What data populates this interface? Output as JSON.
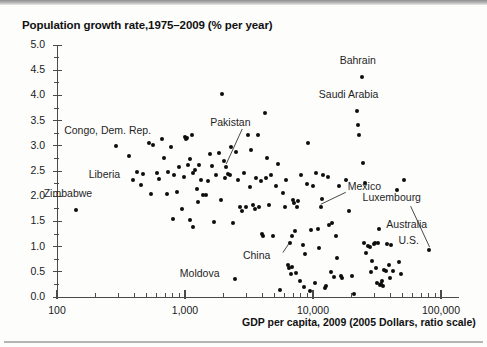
{
  "figure": {
    "title": "Population growth rate,1975–2009 (% per year)",
    "xaxis_title": "GDP per capita, 2009 (2005 Dollars, ratio scale)",
    "dot_color": "#0d0d0d",
    "axis_color": "#4a4a4a"
  },
  "chart_data": {
    "type": "scatter",
    "title": "Population growth rate,1975–2009 (% per year)",
    "xlabel": "GDP per capita, 2009 (2005 Dollars, ratio scale)",
    "ylabel": "Population growth rate,1975–2009 (% per year)",
    "xscale": "log",
    "yscale": "linear",
    "xlim": [
      100,
      100000
    ],
    "ylim": [
      0.0,
      5.0
    ],
    "grid": false,
    "legend": "none",
    "xtick_labels": [
      "100",
      "1,000",
      "10,000",
      "100,000"
    ],
    "xtick_values": [
      100,
      1000,
      10000,
      100000
    ],
    "ytick_labels": [
      "0.0",
      "0.5",
      "1.0",
      "1.5",
      "2.0",
      "2.5",
      "3.0",
      "3.5",
      "4.0",
      "4.5",
      "5.0"
    ],
    "ytick_values": [
      0.0,
      0.5,
      1.0,
      1.5,
      2.0,
      2.5,
      3.0,
      3.5,
      4.0,
      4.5,
      5.0
    ],
    "annotations": [
      {
        "label": "Bahrain",
        "x": 24000,
        "y": 4.37,
        "leader": false
      },
      {
        "label": "Saudi Arabia",
        "x": 22000,
        "y": 3.7,
        "leader": false
      },
      {
        "label": "Pakistan",
        "x": 2100,
        "y": 2.58,
        "leader": true
      },
      {
        "label": "Congo, Dem. Rep.",
        "x": 290,
        "y": 2.99,
        "leader": false
      },
      {
        "label": "Liberia",
        "x": 390,
        "y": 2.33,
        "leader": false
      },
      {
        "label": "Zimbabwe",
        "x": 140,
        "y": 1.72,
        "leader": false
      },
      {
        "label": "Moldova",
        "x": 2450,
        "y": 0.35,
        "leader": false
      },
      {
        "label": "Mexico",
        "x": 11500,
        "y": 1.78,
        "leader": true
      },
      {
        "label": "China",
        "x": 6600,
        "y": 1.08,
        "leader": true
      },
      {
        "label": "Luxembourg",
        "x": 80000,
        "y": 0.93,
        "leader": true
      },
      {
        "label": "Australia",
        "x": 33000,
        "y": 1.35,
        "leader": false
      },
      {
        "label": "U.S.",
        "x": 41000,
        "y": 1.04,
        "leader": false
      }
    ],
    "points": [
      {
        "x": 140,
        "y": 1.72
      },
      {
        "x": 290,
        "y": 2.99
      },
      {
        "x": 390,
        "y": 2.33
      },
      {
        "x": 365,
        "y": 2.79
      },
      {
        "x": 420,
        "y": 2.48
      },
      {
        "x": 455,
        "y": 2.22
      },
      {
        "x": 470,
        "y": 2.45
      },
      {
        "x": 520,
        "y": 3.05
      },
      {
        "x": 540,
        "y": 2.05
      },
      {
        "x": 560,
        "y": 3.01
      },
      {
        "x": 600,
        "y": 2.46
      },
      {
        "x": 630,
        "y": 2.35
      },
      {
        "x": 660,
        "y": 3.13
      },
      {
        "x": 690,
        "y": 2.76
      },
      {
        "x": 720,
        "y": 2.04
      },
      {
        "x": 740,
        "y": 2.48
      },
      {
        "x": 780,
        "y": 2.98
      },
      {
        "x": 800,
        "y": 1.55
      },
      {
        "x": 820,
        "y": 2.42
      },
      {
        "x": 860,
        "y": 2.09
      },
      {
        "x": 900,
        "y": 2.58
      },
      {
        "x": 940,
        "y": 1.75
      },
      {
        "x": 980,
        "y": 2.38
      },
      {
        "x": 1000,
        "y": 3.18
      },
      {
        "x": 1010,
        "y": 3.13
      },
      {
        "x": 1040,
        "y": 3.16
      },
      {
        "x": 1060,
        "y": 2.62
      },
      {
        "x": 1090,
        "y": 1.52
      },
      {
        "x": 1100,
        "y": 2.73
      },
      {
        "x": 1130,
        "y": 3.22
      },
      {
        "x": 1150,
        "y": 2.46
      },
      {
        "x": 1160,
        "y": 1.38
      },
      {
        "x": 1200,
        "y": 2.51
      },
      {
        "x": 1230,
        "y": 2.15
      },
      {
        "x": 1260,
        "y": 1.88
      },
      {
        "x": 1290,
        "y": 2.61
      },
      {
        "x": 1340,
        "y": 2.33
      },
      {
        "x": 1380,
        "y": 2.02
      },
      {
        "x": 1450,
        "y": 2.03
      },
      {
        "x": 1500,
        "y": 2.3
      },
      {
        "x": 1560,
        "y": 2.84
      },
      {
        "x": 1620,
        "y": 2.6
      },
      {
        "x": 1700,
        "y": 1.48
      },
      {
        "x": 1760,
        "y": 2.43
      },
      {
        "x": 1830,
        "y": 2.86
      },
      {
        "x": 1900,
        "y": 1.92
      },
      {
        "x": 1950,
        "y": 4.03
      },
      {
        "x": 2000,
        "y": 2.69
      },
      {
        "x": 2050,
        "y": 2.36
      },
      {
        "x": 2100,
        "y": 2.58
      },
      {
        "x": 2150,
        "y": 2.44
      },
      {
        "x": 2250,
        "y": 2.43
      },
      {
        "x": 2300,
        "y": 2.98
      },
      {
        "x": 2380,
        "y": 1.47
      },
      {
        "x": 2450,
        "y": 0.35
      },
      {
        "x": 2500,
        "y": 2.88
      },
      {
        "x": 2600,
        "y": 2.33
      },
      {
        "x": 2700,
        "y": 1.79
      },
      {
        "x": 2800,
        "y": 1.71
      },
      {
        "x": 2900,
        "y": 2.47
      },
      {
        "x": 3000,
        "y": 1.78
      },
      {
        "x": 3100,
        "y": 3.22
      },
      {
        "x": 3200,
        "y": 2.19
      },
      {
        "x": 3300,
        "y": 2.91
      },
      {
        "x": 3400,
        "y": 1.83
      },
      {
        "x": 3500,
        "y": 1.74
      },
      {
        "x": 3600,
        "y": 2.37
      },
      {
        "x": 3700,
        "y": 3.21
      },
      {
        "x": 3800,
        "y": 1.79
      },
      {
        "x": 3900,
        "y": 2.3
      },
      {
        "x": 4000,
        "y": 1.25
      },
      {
        "x": 4100,
        "y": 1.22
      },
      {
        "x": 4200,
        "y": 3.66
      },
      {
        "x": 4300,
        "y": 2.36
      },
      {
        "x": 4400,
        "y": 2.76
      },
      {
        "x": 4500,
        "y": 1.82
      },
      {
        "x": 4700,
        "y": 2.43
      },
      {
        "x": 4900,
        "y": 1.21
      },
      {
        "x": 5100,
        "y": 2.21
      },
      {
        "x": 5300,
        "y": 2.63
      },
      {
        "x": 5500,
        "y": 0.14
      },
      {
        "x": 5800,
        "y": 2.07
      },
      {
        "x": 6000,
        "y": 1.78
      },
      {
        "x": 6200,
        "y": 2.32
      },
      {
        "x": 6400,
        "y": 0.64
      },
      {
        "x": 6500,
        "y": 0.58
      },
      {
        "x": 6600,
        "y": 1.08
      },
      {
        "x": 6700,
        "y": 0.46
      },
      {
        "x": 6800,
        "y": 1.21
      },
      {
        "x": 6900,
        "y": 0.59
      },
      {
        "x": 7000,
        "y": 1.93
      },
      {
        "x": 7100,
        "y": 1.86
      },
      {
        "x": 7200,
        "y": 1.31
      },
      {
        "x": 7300,
        "y": 0.48
      },
      {
        "x": 7500,
        "y": 1.78
      },
      {
        "x": 7700,
        "y": 1.91
      },
      {
        "x": 7900,
        "y": 0.32
      },
      {
        "x": 8100,
        "y": 2.43
      },
      {
        "x": 8300,
        "y": 1.04
      },
      {
        "x": 8500,
        "y": 0.19
      },
      {
        "x": 8700,
        "y": 0.86
      },
      {
        "x": 8900,
        "y": 2.25
      },
      {
        "x": 9100,
        "y": 3.06
      },
      {
        "x": 9400,
        "y": 0.12
      },
      {
        "x": 9700,
        "y": 1.33
      },
      {
        "x": 10000,
        "y": 2.21
      },
      {
        "x": 10300,
        "y": 0.28
      },
      {
        "x": 10600,
        "y": 2.47
      },
      {
        "x": 10900,
        "y": 1.34
      },
      {
        "x": 11200,
        "y": 0.97
      },
      {
        "x": 11500,
        "y": 1.78
      },
      {
        "x": 11800,
        "y": 1.94
      },
      {
        "x": 12000,
        "y": 2.42
      },
      {
        "x": 12300,
        "y": 0.17
      },
      {
        "x": 12600,
        "y": 0.22
      },
      {
        "x": 13000,
        "y": 2.38
      },
      {
        "x": 13400,
        "y": 1.42
      },
      {
        "x": 13800,
        "y": 0.49
      },
      {
        "x": 14200,
        "y": 1.46
      },
      {
        "x": 14600,
        "y": 0.39
      },
      {
        "x": 15000,
        "y": 1.22
      },
      {
        "x": 15500,
        "y": 0.78
      },
      {
        "x": 16000,
        "y": 2.2
      },
      {
        "x": 16500,
        "y": 0.41
      },
      {
        "x": 17000,
        "y": 0.37
      },
      {
        "x": 18000,
        "y": 2.33
      },
      {
        "x": 19000,
        "y": 1.7
      },
      {
        "x": 20000,
        "y": 0.42
      },
      {
        "x": 21000,
        "y": 0.06
      },
      {
        "x": 22000,
        "y": 3.7
      },
      {
        "x": 22500,
        "y": 3.42
      },
      {
        "x": 23000,
        "y": 3.21
      },
      {
        "x": 24000,
        "y": 4.37
      },
      {
        "x": 24500,
        "y": 2.65
      },
      {
        "x": 25000,
        "y": 1.08
      },
      {
        "x": 25500,
        "y": 2.27
      },
      {
        "x": 26000,
        "y": 0.88
      },
      {
        "x": 27000,
        "y": 1.02
      },
      {
        "x": 28000,
        "y": 0.99
      },
      {
        "x": 28500,
        "y": 0.49
      },
      {
        "x": 29000,
        "y": 0.72
      },
      {
        "x": 30000,
        "y": 1.06
      },
      {
        "x": 30500,
        "y": 1.08
      },
      {
        "x": 31000,
        "y": 0.57
      },
      {
        "x": 31500,
        "y": 0.27
      },
      {
        "x": 32000,
        "y": 1.08
      },
      {
        "x": 33000,
        "y": 1.35
      },
      {
        "x": 33500,
        "y": 0.23
      },
      {
        "x": 34000,
        "y": 0.26
      },
      {
        "x": 34500,
        "y": 0.31
      },
      {
        "x": 35000,
        "y": 0.21
      },
      {
        "x": 36000,
        "y": 0.54
      },
      {
        "x": 37000,
        "y": 0.52
      },
      {
        "x": 38000,
        "y": 1.06
      },
      {
        "x": 39000,
        "y": 0.63
      },
      {
        "x": 40000,
        "y": 0.38
      },
      {
        "x": 41000,
        "y": 1.04
      },
      {
        "x": 42000,
        "y": 0.51
      },
      {
        "x": 45000,
        "y": 2.12
      },
      {
        "x": 47000,
        "y": 0.7
      },
      {
        "x": 49000,
        "y": 0.45
      },
      {
        "x": 51000,
        "y": 2.33
      },
      {
        "x": 80000,
        "y": 0.93
      }
    ]
  }
}
